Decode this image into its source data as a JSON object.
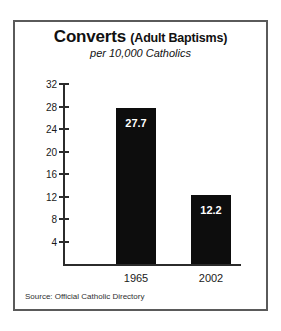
{
  "chart_data": {
    "type": "bar",
    "title": "Converts",
    "title_suffix": "(Adult Baptisms)",
    "subtitle": "per 10,000 Catholics",
    "categories": [
      "1965",
      "2002"
    ],
    "values": [
      27.7,
      12.2
    ],
    "value_labels": [
      "27.7",
      "12.2"
    ],
    "xlabel": "",
    "ylabel": "",
    "ylim": [
      0,
      32
    ],
    "yticks": [
      32,
      28,
      24,
      20,
      16,
      12,
      8,
      4
    ],
    "ytick_labels": [
      "32",
      "28",
      "24",
      "20",
      "16",
      "12",
      "8",
      "4"
    ],
    "grid": false,
    "legend": false,
    "bar_color": "#0d0d0d",
    "background_color": "#ffffff",
    "border_color": "#5a5a5a",
    "source": "Source: Official Catholic Directory"
  }
}
